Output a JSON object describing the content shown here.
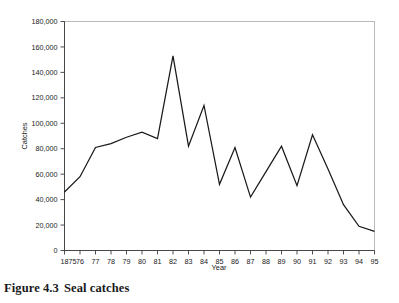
{
  "caption": {
    "label": "Figure 4.3",
    "text": "Seal catches"
  },
  "chart_data": {
    "type": "line",
    "title": "",
    "xlabel": "Year",
    "ylabel": "Catches",
    "x": [
      1875,
      1876,
      1877,
      1878,
      1879,
      1880,
      1881,
      1882,
      1883,
      1884,
      1885,
      1886,
      1887,
      1888,
      1889,
      1890,
      1891,
      1892,
      1893,
      1894,
      1895
    ],
    "categories": [
      "1875",
      "76",
      "77",
      "78",
      "79",
      "80",
      "81",
      "82",
      "83",
      "84",
      "85",
      "86",
      "87",
      "88",
      "89",
      "90",
      "91",
      "92",
      "93",
      "94",
      "95"
    ],
    "values": [
      46000,
      58000,
      81000,
      84000,
      89000,
      93000,
      88000,
      153000,
      82000,
      114000,
      52000,
      81000,
      42000,
      62000,
      82000,
      51000,
      91000,
      64000,
      36000,
      19000,
      15000
    ],
    "xlim": [
      1875,
      1895
    ],
    "ylim": [
      0,
      180000
    ],
    "ytick_values": [
      0,
      20000,
      40000,
      60000,
      80000,
      100000,
      120000,
      140000,
      160000,
      180000
    ],
    "ytick_labels": [
      "0",
      "20,000",
      "40,000",
      "60,000",
      "80,000",
      "100,000",
      "120,000",
      "140,000",
      "160,000",
      "180,000"
    ],
    "grid": false,
    "legend": null,
    "line_color": "#1a1a1a",
    "frame_color": "#b9b9b9"
  }
}
